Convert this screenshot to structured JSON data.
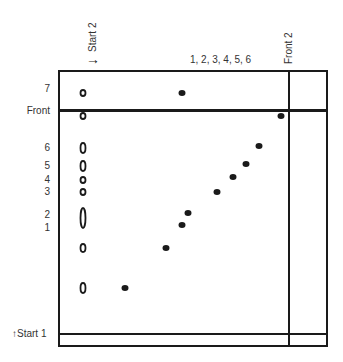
{
  "diagram": {
    "type": "two-dimensional thin-layer chromatogram",
    "top_labels": {
      "start2": "Start 2",
      "direction2_arrow": "→",
      "spot_group": "1, 2, 3, 4, 5, 6",
      "front2": "Front 2"
    },
    "left_labels": [
      {
        "text": "7",
        "y": 89
      },
      {
        "text": "Front",
        "y": 111
      },
      {
        "text": "6",
        "y": 148
      },
      {
        "text": "5",
        "y": 166
      },
      {
        "text": "4",
        "y": 180
      },
      {
        "text": "3",
        "y": 192
      },
      {
        "text": "2",
        "y": 215
      },
      {
        "text": "1",
        "y": 228
      }
    ],
    "bottom_label": "↑Start 1",
    "first_dimension_spots": [
      {
        "x": 83,
        "y": 93,
        "label": "7"
      },
      {
        "x": 83,
        "y": 116,
        "label": "front"
      },
      {
        "x": 83,
        "y": 148,
        "label": "6"
      },
      {
        "x": 83,
        "y": 166,
        "label": "5"
      },
      {
        "x": 83,
        "y": 180,
        "label": "4"
      },
      {
        "x": 83,
        "y": 192,
        "label": "3"
      },
      {
        "x": 83,
        "y": 218,
        "label": "1-2"
      },
      {
        "x": 83,
        "y": 248,
        "label": "-"
      },
      {
        "x": 83,
        "y": 288,
        "label": "-"
      }
    ],
    "second_dimension_spots": [
      {
        "x": 182,
        "y": 93
      },
      {
        "x": 281,
        "y": 116
      },
      {
        "x": 259,
        "y": 146
      },
      {
        "x": 246,
        "y": 164
      },
      {
        "x": 233,
        "y": 177
      },
      {
        "x": 217,
        "y": 192
      },
      {
        "x": 188,
        "y": 213
      },
      {
        "x": 182,
        "y": 225
      },
      {
        "x": 166,
        "y": 248
      },
      {
        "x": 125,
        "y": 288
      }
    ]
  }
}
